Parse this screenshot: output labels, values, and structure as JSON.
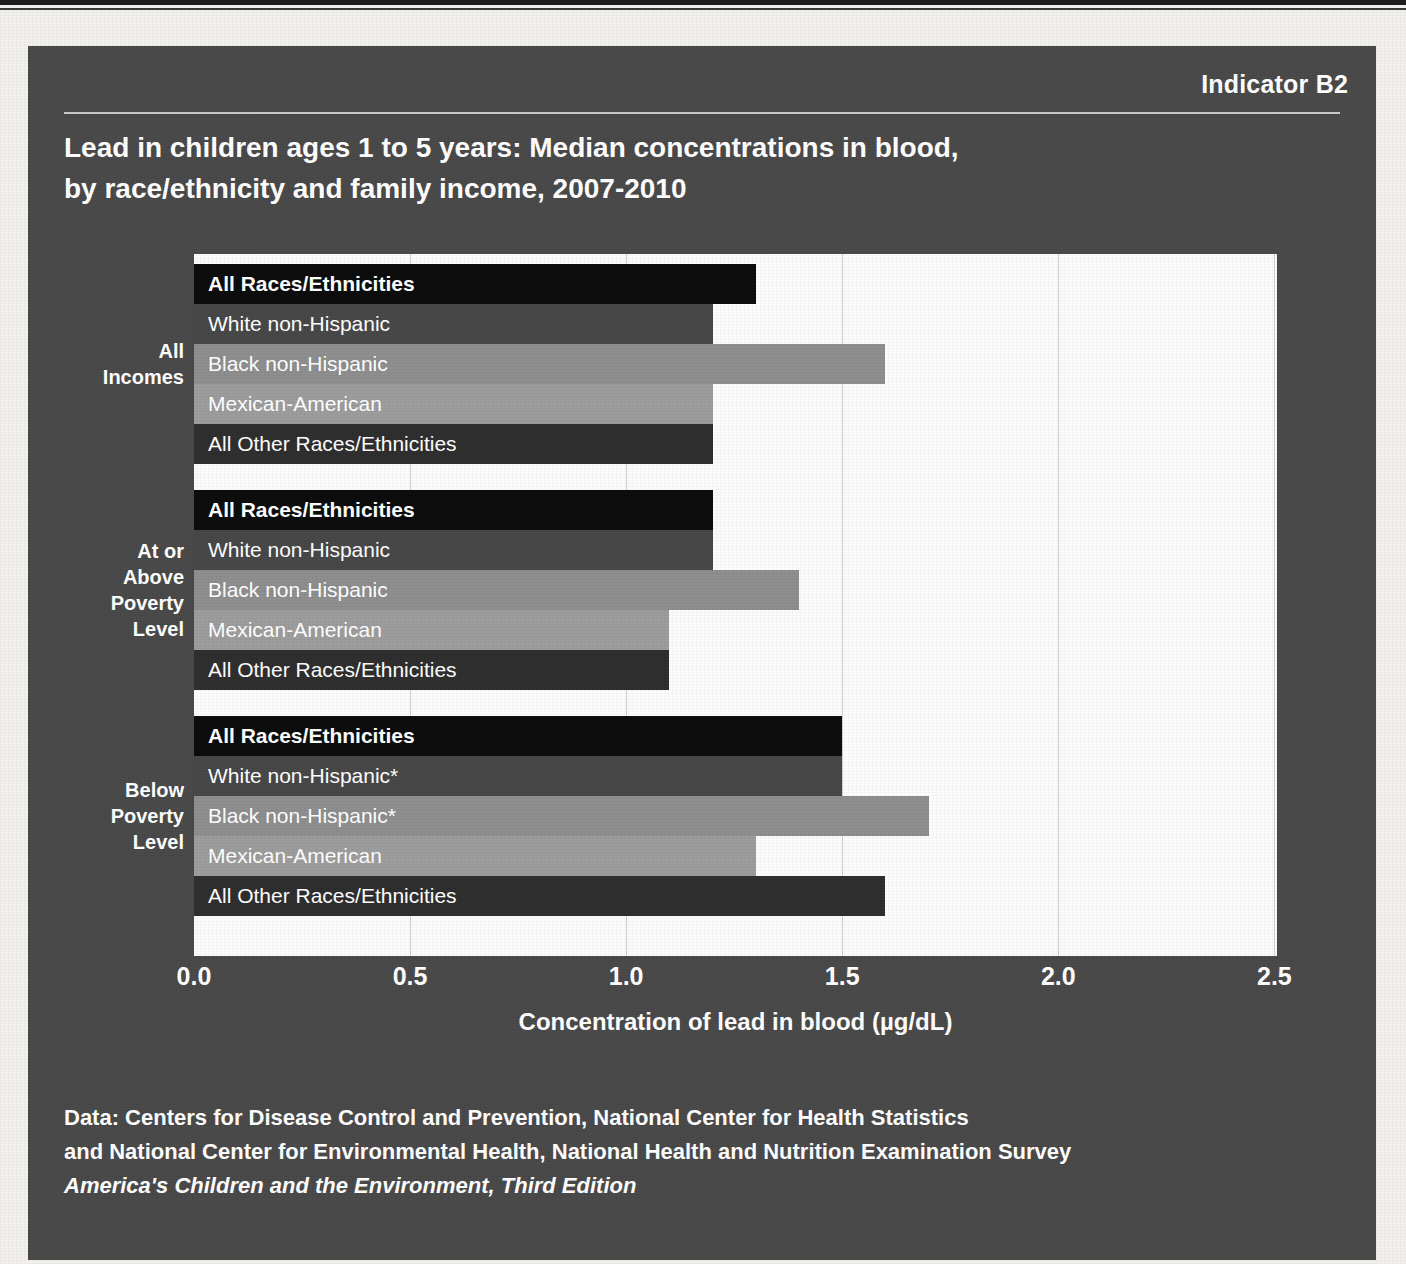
{
  "indicator": "Indicator B2",
  "title": "Lead in children ages 1 to 5 years: Median concentrations in blood, by race/ethnicity and family income, 2007-2010",
  "title_line1": "Lead in children ages 1 to 5 years: Median concentrations in blood,",
  "title_line2": "by race/ethnicity and family income, 2007-2010",
  "footer": {
    "line1": "Data: Centers for Disease Control and Prevention, National Center for Health Statistics",
    "line2": "and National Center for Environmental Health, National Health and Nutrition Examination Survey",
    "line3": "America's Children and the Environment, Third Edition"
  },
  "colors": {
    "panel_background": "#4a4a4a",
    "plot_background": "#fcfcfc",
    "gridline": "#d0d0d0",
    "all_races": "#0d0d0d",
    "white_non_hispanic": "#484848",
    "black_non_hispanic": "#8f8f8f",
    "mexican_american": "#9d9d9d",
    "all_other": "#2f2f2f",
    "text": "#ffffff"
  },
  "chart_data": {
    "type": "bar",
    "orientation": "horizontal",
    "title": "Lead in children ages 1 to 5 years: Median concentrations in blood, by race/ethnicity and family income, 2007-2010",
    "xlabel": "Concentration of lead in blood (µg/dL)",
    "ylabel": "",
    "xlim": [
      0.0,
      2.506
    ],
    "xticks": [
      0.0,
      0.5,
      1.0,
      1.5,
      2.0,
      2.5
    ],
    "xtick_labels": [
      "0.0",
      "0.5",
      "1.0",
      "1.5",
      "2.0",
      "2.5"
    ],
    "grid": "vertical",
    "legend": "none",
    "footnote_marker": "*",
    "groups": [
      {
        "label": "All Incomes",
        "label_lines": [
          "All",
          "Incomes"
        ],
        "bars": [
          {
            "label": "All Races/Ethnicities",
            "value": 1.3,
            "color": "#0d0d0d",
            "emphasis": true
          },
          {
            "label": "White non-Hispanic",
            "value": 1.2,
            "color": "#484848",
            "emphasis": false
          },
          {
            "label": "Black non-Hispanic",
            "value": 1.6,
            "color": "#8f8f8f",
            "emphasis": false
          },
          {
            "label": "Mexican-American",
            "value": 1.2,
            "color": "#9d9d9d",
            "emphasis": false
          },
          {
            "label": "All Other Races/Ethnicities",
            "value": 1.2,
            "color": "#2f2f2f",
            "emphasis": false
          }
        ]
      },
      {
        "label": "At or Above Poverty Level",
        "label_lines": [
          "At or",
          "Above",
          "Poverty",
          "Level"
        ],
        "bars": [
          {
            "label": "All Races/Ethnicities",
            "value": 1.2,
            "color": "#0d0d0d",
            "emphasis": true
          },
          {
            "label": "White non-Hispanic",
            "value": 1.2,
            "color": "#484848",
            "emphasis": false
          },
          {
            "label": "Black non-Hispanic",
            "value": 1.4,
            "color": "#8f8f8f",
            "emphasis": false
          },
          {
            "label": "Mexican-American",
            "value": 1.1,
            "color": "#9d9d9d",
            "emphasis": false
          },
          {
            "label": "All Other Races/Ethnicities",
            "value": 1.1,
            "color": "#2f2f2f",
            "emphasis": false
          }
        ]
      },
      {
        "label": "Below Poverty Level",
        "label_lines": [
          "Below",
          "Poverty",
          "Level"
        ],
        "bars": [
          {
            "label": "All Races/Ethnicities",
            "value": 1.5,
            "color": "#0d0d0d",
            "emphasis": true
          },
          {
            "label": "White non-Hispanic*",
            "value": 1.5,
            "color": "#484848",
            "emphasis": false
          },
          {
            "label": "Black non-Hispanic*",
            "value": 1.7,
            "color": "#8f8f8f",
            "emphasis": false
          },
          {
            "label": "Mexican-American",
            "value": 1.3,
            "color": "#9d9d9d",
            "emphasis": false
          },
          {
            "label": "All Other Races/Ethnicities",
            "value": 1.6,
            "color": "#2f2f2f",
            "emphasis": false
          }
        ]
      }
    ]
  }
}
